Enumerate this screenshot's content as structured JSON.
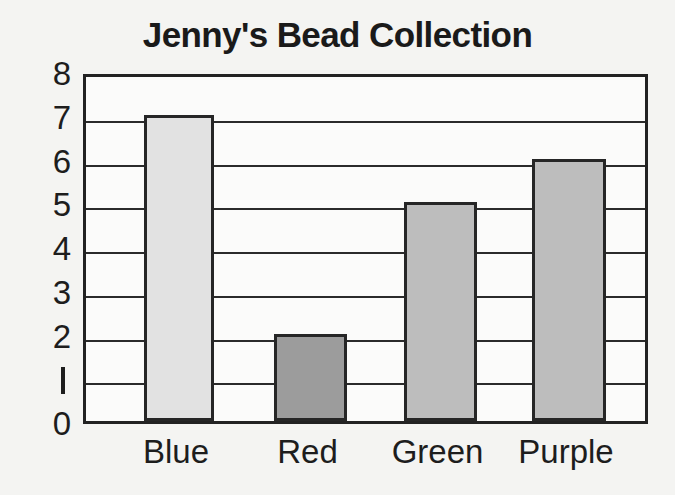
{
  "chart_data": {
    "type": "bar",
    "title": "Jenny's Bead Collection",
    "categories": [
      "Blue",
      "Red",
      "Green",
      "Purple"
    ],
    "values": [
      7,
      2,
      5,
      6
    ],
    "xlabel": "",
    "ylabel": "",
    "ylim": [
      0,
      8
    ],
    "ytick_labels": [
      "8",
      "7",
      "6",
      "5",
      "4",
      "3",
      "2",
      "1",
      "0"
    ],
    "ytick_values": [
      8,
      7,
      6,
      5,
      4,
      3,
      2,
      1,
      0
    ],
    "grid": true,
    "legend": "none",
    "bar_fills": [
      "#e2e2e2",
      "#9c9c9c",
      "#bdbdbd",
      "#bdbdbd"
    ],
    "bar_outline_color": "#262626",
    "axis_color": "#222222",
    "background_color": "#f4f4f2",
    "plot_background_color": "#fbfbfa",
    "text_color": "#1d1d1d"
  }
}
